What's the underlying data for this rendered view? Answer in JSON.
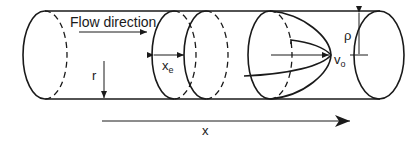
{
  "diagram": {
    "labels": {
      "flow_direction": "Flow direction",
      "x_e_main": "x",
      "x_e_sub": "e",
      "r": "r",
      "v_o_main": "v",
      "v_o_sub": "o",
      "rho": "ρ",
      "x_axis": "x"
    },
    "colors": {
      "stroke": "#1a1a1a",
      "background": "#ffffff"
    }
  }
}
